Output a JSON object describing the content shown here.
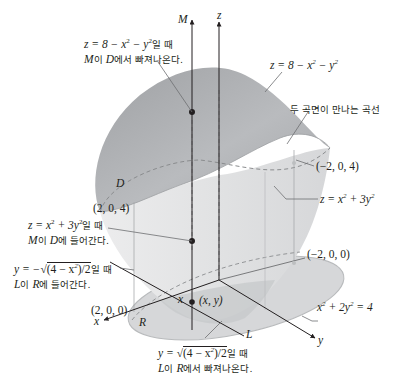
{
  "figure": {
    "axes": {
      "z_label": "z",
      "M_label": "M",
      "x_label": "x",
      "y_label": "y",
      "L_label": "L",
      "x_point_label": "x"
    },
    "regions": {
      "D_label": "D",
      "R_label": "R"
    },
    "surfaces": {
      "top": {
        "equation_prefix": "z = 8 − x",
        "exp1": "2",
        "mid": " − y",
        "exp2": "2",
        "color": "#a7a9ac"
      },
      "bottom": {
        "equation_prefix": "z = x",
        "exp1": "2",
        "mid": " + 3y",
        "exp2": "2",
        "color": "#e6e7e8"
      },
      "ellipse": {
        "equation_prefix": "x",
        "exp1": "2",
        "mid": " + 2y",
        "exp2": "2",
        "suffix": " = 4",
        "color": "#d1d3d4"
      }
    },
    "points": {
      "p_2_0_4": "(2, 0, 4)",
      "p_m2_0_4": "(−2, 0, 4)",
      "p_2_0_0": "(2, 0, 0)",
      "p_m2_0_0": "(−2, 0, 0)",
      "p_xy": "(x, y)"
    },
    "annotations": {
      "exit_top": {
        "line1_eq": "z = 8 − x",
        "line1_exp1": "2",
        "line1_mid": " − y",
        "line1_exp2": "2",
        "line1_kr": "일 때",
        "line2_M": "M",
        "line2_kr1": "이 ",
        "line2_D": "D",
        "line2_kr2": "에서 빠져나온다."
      },
      "intersection_curve": "두 곡면이 만나는 곡선",
      "enter_bottom": {
        "line1_eq": "z = x",
        "line1_exp1": "2",
        "line1_mid": " + 3y",
        "line1_exp2": "2",
        "line1_kr": "일 때",
        "line2_M": "M",
        "line2_kr1": "이 ",
        "line2_D": "D",
        "line2_kr2": "에 들어간다."
      },
      "enter_R": {
        "line1_pre": "y = −",
        "line1_rad": "(4 − x",
        "line1_exp": "2",
        "line1_rad2": ")/2",
        "line1_kr": "일 때",
        "line2_L": "L",
        "line2_kr1": "이 ",
        "line2_R": "R",
        "line2_kr2": "에 들어간다."
      },
      "exit_R": {
        "line1_pre": "y = ",
        "line1_rad": "(4 − x",
        "line1_exp": "2",
        "line1_rad2": ")/2",
        "line1_kr": "일 때",
        "line2_L": "L",
        "line2_kr1": "이 ",
        "line2_R": "R",
        "line2_kr2": "에서 빠져나온다."
      }
    },
    "colors": {
      "line": "#231f20",
      "leader": "#6d6e71",
      "dashed": "#8a8c8e"
    }
  }
}
